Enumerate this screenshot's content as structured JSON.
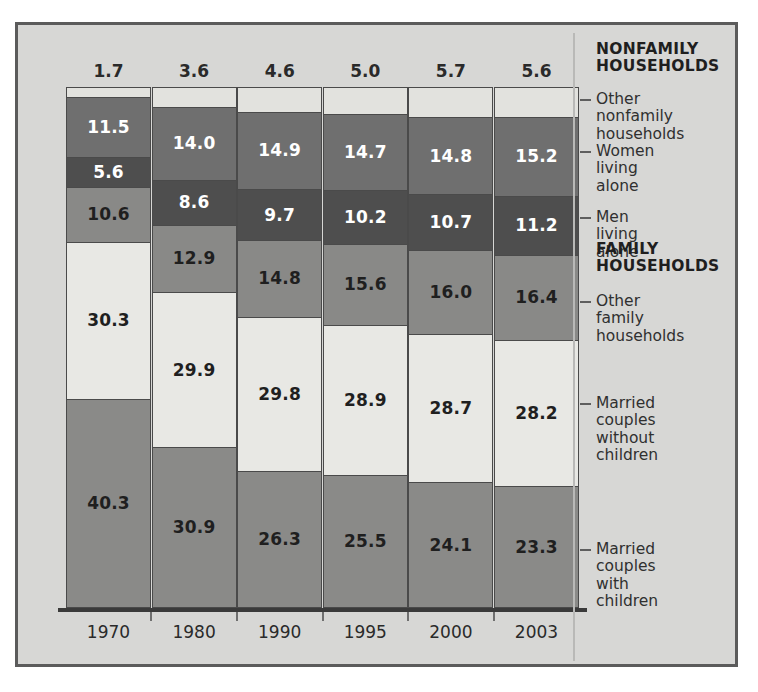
{
  "chart_data": {
    "type": "bar",
    "subtype": "stacked-100-percent-vertical",
    "title": "",
    "xlabel": "",
    "ylabel": "",
    "ylim": [
      0,
      100
    ],
    "grid": false,
    "legend_position": "right",
    "categories": [
      "1970",
      "1980",
      "1990",
      "1995",
      "2000",
      "2003"
    ],
    "stack_order_top_to_bottom": [
      "Other nonfamily households",
      "Women living alone",
      "Men living alone",
      "Other family households",
      "Married couples without children",
      "Married couples with children"
    ],
    "series": [
      {
        "name": "Other nonfamily households",
        "group": "NONFAMILY HOUSEHOLDS",
        "color": "#e2e2de",
        "text_color": "#2a2a2a",
        "label_inside": false,
        "values": [
          1.7,
          3.6,
          4.6,
          5.0,
          5.7,
          5.6
        ]
      },
      {
        "name": "Women living alone",
        "group": "NONFAMILY HOUSEHOLDS",
        "color": "#6f6f6f",
        "text_color": "#ffffff",
        "label_inside": true,
        "values": [
          11.5,
          14.0,
          14.9,
          14.7,
          14.8,
          15.2
        ]
      },
      {
        "name": "Men living alone",
        "group": "NONFAMILY HOUSEHOLDS",
        "color": "#4e4e4e",
        "text_color": "#ffffff",
        "label_inside": true,
        "values": [
          5.6,
          8.6,
          9.7,
          10.2,
          10.7,
          11.2
        ]
      },
      {
        "name": "Other family households",
        "group": "FAMILY HOUSEHOLDS",
        "color": "#898987",
        "text_color": "#1f1f1f",
        "label_inside": true,
        "values": [
          10.6,
          12.9,
          14.8,
          15.6,
          16.0,
          16.4
        ]
      },
      {
        "name": "Married couples without children",
        "group": "FAMILY HOUSEHOLDS",
        "color": "#e8e8e4",
        "text_color": "#1f1f1f",
        "label_inside": true,
        "values": [
          30.3,
          29.9,
          29.8,
          28.9,
          28.7,
          28.2
        ]
      },
      {
        "name": "Married couples with children",
        "group": "FAMILY HOUSEHOLDS",
        "color": "#8a8a88",
        "text_color": "#1f1f1f",
        "label_inside": true,
        "values": [
          40.3,
          30.9,
          26.3,
          25.5,
          24.1,
          23.3
        ]
      }
    ]
  },
  "top_labels": [
    "1.7",
    "3.6",
    "4.6",
    "5.0",
    "5.7",
    "5.6"
  ],
  "bars": [
    {
      "year": "1970",
      "values": [
        "1.7",
        "11.5",
        "5.6",
        "10.6",
        "30.3",
        "40.3"
      ]
    },
    {
      "year": "1980",
      "values": [
        "3.6",
        "14.0",
        "8.6",
        "12.9",
        "29.9",
        "30.9"
      ]
    },
    {
      "year": "1990",
      "values": [
        "4.6",
        "14.9",
        "9.7",
        "14.8",
        "29.8",
        "26.3"
      ]
    },
    {
      "year": "1995",
      "values": [
        "5.0",
        "14.7",
        "10.2",
        "15.6",
        "28.9",
        "25.5"
      ]
    },
    {
      "year": "2000",
      "values": [
        "5.7",
        "14.8",
        "10.7",
        "16.0",
        "28.7",
        "24.1"
      ]
    },
    {
      "year": "2003",
      "values": [
        "5.6",
        "15.2",
        "11.2",
        "16.4",
        "28.2",
        "23.3"
      ]
    }
  ],
  "legend": {
    "entries": [
      {
        "text": "NONFAMILY\nHOUSEHOLDS",
        "kind": "header"
      },
      {
        "text": "Other nonfamily\nhouseholds",
        "kind": "item"
      },
      {
        "text": "Women living\nalone",
        "kind": "item"
      },
      {
        "text": "Men living alone",
        "kind": "item"
      },
      {
        "text": "FAMILY\nHOUSEHOLDS",
        "kind": "header"
      },
      {
        "text": "Other family\nhouseholds",
        "kind": "item"
      },
      {
        "text": "Married couples\nwithout children",
        "kind": "item"
      },
      {
        "text": "Married couples\nwith children",
        "kind": "item"
      }
    ]
  },
  "axis": {
    "years": [
      "1970",
      "1980",
      "1990",
      "1995",
      "2000",
      "2003"
    ]
  },
  "colors": {
    "background": "#d7d7d5",
    "frame_border": "#5b5b5b",
    "axis_line": "#3a3a3a",
    "segment_border": "#4a4a4a"
  }
}
